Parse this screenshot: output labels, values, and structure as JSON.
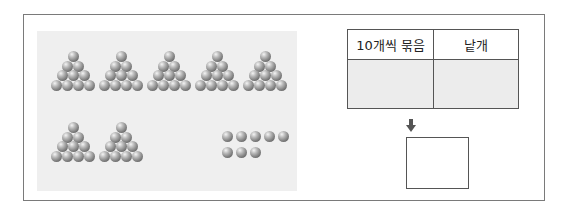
{
  "problem": {
    "groups_of_ten_count": 7,
    "loose_count": 8,
    "loose_rows": [
      5,
      3
    ],
    "ball_color": "#7d7d7d",
    "panel_color": "#efefef"
  },
  "table": {
    "headers": [
      "10개씩 묶음",
      "낱개"
    ],
    "values": [
      "",
      ""
    ],
    "value_cell_color": "#ececec"
  },
  "arrow": {
    "icon": "down-arrow-icon",
    "glyph": "⬇"
  },
  "answer_box": {
    "value": ""
  }
}
